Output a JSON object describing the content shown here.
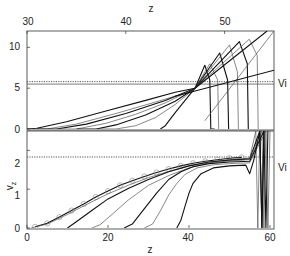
{
  "chart_data": [
    {
      "panel": "top",
      "type": "line",
      "title": "",
      "xlabel": "z",
      "ylabel": "",
      "xlabel_position": "top",
      "xlim": [
        30,
        55
      ],
      "ylim": [
        0,
        12
      ],
      "xticks": [
        30,
        40,
        50
      ],
      "yticks": [
        0,
        5,
        10
      ],
      "grid": false,
      "annotations": [
        {
          "text": "Vi",
          "y": 5.5
        }
      ],
      "reference_lines": [
        {
          "name": "Vi",
          "y": 5.5,
          "style": "solid"
        },
        {
          "name": "dotted",
          "y": 5.8,
          "style": "dotted"
        }
      ],
      "series": [
        {
          "name": "profile-1",
          "x": [
            30,
            31,
            34,
            38,
            42,
            45,
            47,
            48,
            48.5,
            48.6,
            49
          ],
          "y": [
            0,
            0.1,
            0.9,
            2.2,
            3.5,
            4.5,
            5.0,
            7.8,
            6.0,
            0,
            0
          ]
        },
        {
          "name": "profile-2",
          "x": [
            30,
            32,
            35,
            39,
            43,
            46,
            47,
            48.5,
            49.3,
            49.4
          ],
          "y": [
            0,
            0,
            0.6,
            1.9,
            3.3,
            4.4,
            5.0,
            8.0,
            6.0,
            0
          ]
        },
        {
          "name": "profile-3",
          "x": [
            31,
            33,
            36,
            40,
            44,
            47,
            49.5,
            50.3,
            50.4
          ],
          "y": [
            0,
            0,
            0.6,
            1.9,
            3.5,
            5.0,
            9.3,
            6.0,
            0
          ]
        },
        {
          "name": "profile-4",
          "x": [
            33,
            35,
            38,
            41,
            44,
            47,
            50.5,
            51.3,
            51.4
          ],
          "y": [
            0,
            0,
            0.7,
            1.8,
            3.2,
            5.0,
            10.3,
            7.0,
            0
          ]
        },
        {
          "name": "profile-5",
          "x": [
            35,
            37,
            39,
            42,
            45,
            47,
            51.5,
            52.3,
            52.4
          ],
          "y": [
            0,
            0,
            0.5,
            1.7,
            3.4,
            5.0,
            10.7,
            8.0,
            0
          ]
        },
        {
          "name": "profile-6",
          "x": [
            37,
            39,
            41,
            43,
            45,
            47,
            52.5,
            53.3,
            53.4
          ],
          "y": [
            0,
            0,
            0.4,
            1.4,
            3.0,
            5.0,
            11.0,
            9.0,
            0
          ]
        },
        {
          "name": "profile-7",
          "x": [
            43.5,
            44,
            45,
            47,
            54.3
          ],
          "y": [
            0,
            0.4,
            2.0,
            5.0,
            12
          ]
        },
        {
          "name": "tangent-line",
          "x": [
            48,
            55
          ],
          "y": [
            1.0,
            12
          ]
        },
        {
          "name": "slope-line",
          "x": [
            45,
            55
          ],
          "y": [
            4.0,
            7.2
          ]
        }
      ]
    },
    {
      "panel": "bottom",
      "type": "line",
      "title": "",
      "xlabel": "z",
      "ylabel": "v_z",
      "xlim": [
        0,
        61
      ],
      "ylim": [
        0,
        2.5
      ],
      "xticks": [
        0,
        20,
        40,
        60
      ],
      "yticks": [
        0,
        1,
        2
      ],
      "grid": false,
      "annotations": [
        {
          "text": "Vi",
          "y": 1.83
        }
      ],
      "reference_lines": [
        {
          "name": "Vi",
          "y": 1.83,
          "style": "dotted"
        }
      ],
      "series": [
        {
          "name": "circles-reference",
          "marker": "circle",
          "x": [
            2,
            5,
            8,
            11,
            14,
            17,
            20,
            23,
            26,
            29,
            32,
            35,
            38,
            41,
            44,
            47,
            50,
            53
          ],
          "y": [
            0.03,
            0.12,
            0.28,
            0.45,
            0.62,
            0.8,
            0.95,
            1.1,
            1.22,
            1.33,
            1.43,
            1.52,
            1.6,
            1.67,
            1.72,
            1.76,
            1.8,
            1.82
          ]
        },
        {
          "name": "profile-1",
          "x": [
            1,
            5,
            10,
            15,
            20,
            25,
            30,
            35,
            40,
            45,
            50,
            55,
            56.5,
            57,
            57.5
          ],
          "y": [
            0,
            0.1,
            0.35,
            0.62,
            0.88,
            1.1,
            1.3,
            1.46,
            1.6,
            1.7,
            1.76,
            1.8,
            2.5,
            0,
            2.5
          ]
        },
        {
          "name": "profile-2",
          "x": [
            10,
            12,
            16,
            20,
            25,
            30,
            35,
            40,
            45,
            50,
            55,
            57.5,
            58,
            58.5
          ],
          "y": [
            0,
            0.15,
            0.45,
            0.75,
            1.02,
            1.25,
            1.45,
            1.6,
            1.7,
            1.75,
            1.78,
            2.5,
            0,
            2.5
          ]
        },
        {
          "name": "profile-3",
          "x": [
            16,
            18,
            21,
            25,
            30,
            35,
            40,
            45,
            50,
            55,
            58,
            58.5,
            59
          ],
          "y": [
            0,
            0.08,
            0.35,
            0.72,
            1.1,
            1.35,
            1.55,
            1.68,
            1.73,
            1.76,
            2.5,
            0,
            2.5
          ]
        },
        {
          "name": "profile-4",
          "x": [
            24,
            26,
            29,
            32,
            35,
            38,
            41,
            45,
            50,
            55,
            58.5,
            59,
            59.5
          ],
          "y": [
            0,
            0.1,
            0.5,
            0.9,
            1.25,
            1.45,
            1.58,
            1.66,
            1.7,
            1.72,
            2.5,
            0,
            2.5
          ]
        },
        {
          "name": "profile-5",
          "x": [
            29,
            31,
            33,
            35,
            37,
            39,
            42,
            46,
            50,
            55,
            59,
            59.5,
            60
          ],
          "y": [
            0,
            0.1,
            0.45,
            0.85,
            1.15,
            1.38,
            1.55,
            1.63,
            1.66,
            1.68,
            2.5,
            0,
            2.5
          ]
        },
        {
          "name": "profile-6",
          "x": [
            37,
            38,
            39,
            40,
            41,
            43,
            46,
            50,
            54,
            55,
            56,
            57.5,
            58,
            58.5
          ],
          "y": [
            0,
            0.2,
            0.55,
            0.9,
            1.15,
            1.4,
            1.55,
            1.6,
            1.62,
            1.4,
            1.75,
            2.5,
            0,
            2.5
          ]
        }
      ]
    }
  ],
  "labels": {
    "top_xlabel": "z",
    "bottom_xlabel": "z",
    "bottom_ylabel": "v",
    "bottom_ylabel_sub": "z",
    "vi_top": "Vi",
    "vi_bottom": "Vi",
    "top_xticks": [
      "30",
      "40",
      "50"
    ],
    "top_yticks": [
      "0",
      "5",
      "10"
    ],
    "bottom_xticks": [
      "0",
      "20",
      "40",
      "60"
    ],
    "bottom_yticks": [
      "0",
      "1",
      "2"
    ]
  }
}
